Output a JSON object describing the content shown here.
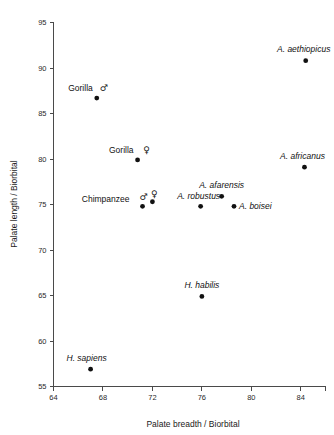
{
  "chart_data": {
    "type": "scatter",
    "title": "",
    "xlabel": "Palate breadth / Biorbital",
    "ylabel": "Palate length / Biorbital",
    "xlim": [
      64,
      86
    ],
    "ylim": [
      55,
      95
    ],
    "xticks": [
      64,
      68,
      72,
      76,
      80,
      84
    ],
    "yticks": [
      55,
      60,
      65,
      70,
      75,
      80,
      85,
      90,
      95
    ],
    "xticklabels": [
      "64",
      "68",
      "72",
      "76",
      "80",
      "84"
    ],
    "yticklabels": [
      "55",
      "60",
      "65",
      "70",
      "75",
      "80",
      "85",
      "90",
      "95"
    ],
    "grid": false,
    "legend": "none",
    "points": [
      {
        "label": "Gorilla",
        "sex_symbol": "♂",
        "italic": false,
        "x": 67.5,
        "y": 86.7,
        "label_dx": -4,
        "label_dy": -7,
        "label_anchor": "end",
        "symbol_dx": 7,
        "symbol_dy": -7
      },
      {
        "label": "Gorilla",
        "sex_symbol": "♀",
        "italic": false,
        "x": 70.8,
        "y": 79.9,
        "label_dx": -4,
        "label_dy": -7,
        "label_anchor": "end",
        "symbol_dx": 9,
        "symbol_dy": -7
      },
      {
        "label": "Chimpanzee",
        "sex_symbol": "♂",
        "italic": false,
        "x": 71.2,
        "y": 74.8,
        "label_dx": -13,
        "label_dy": -4,
        "label_anchor": "end",
        "symbol_dx": 1,
        "symbol_dy": -6
      },
      {
        "label": "",
        "sex_symbol": "♀",
        "italic": false,
        "x": 72.0,
        "y": 75.3,
        "label_dx": 0,
        "label_dy": 0,
        "label_anchor": "start",
        "symbol_dx": 2,
        "symbol_dy": -5
      },
      {
        "label": "A. robustus",
        "sex_symbol": "",
        "italic": true,
        "x": 75.9,
        "y": 74.8,
        "label_dx": -2,
        "label_dy": -7,
        "label_anchor": "middle",
        "symbol_dx": 0,
        "symbol_dy": 0
      },
      {
        "label": "A. afarensis",
        "sex_symbol": "",
        "italic": true,
        "x": 77.6,
        "y": 75.9,
        "label_dx": 0,
        "label_dy": -8,
        "label_anchor": "middle",
        "symbol_dx": 0,
        "symbol_dy": 0
      },
      {
        "label": "A. boisei",
        "sex_symbol": "",
        "italic": true,
        "x": 78.6,
        "y": 74.8,
        "label_dx": 5,
        "label_dy": 3,
        "label_anchor": "start",
        "symbol_dx": 0,
        "symbol_dy": 0
      },
      {
        "label": "A. africanus",
        "sex_symbol": "",
        "italic": true,
        "x": 84.3,
        "y": 79.1,
        "label_dx": -2,
        "label_dy": -8,
        "label_anchor": "middle",
        "symbol_dx": 0,
        "symbol_dy": 0
      },
      {
        "label": "A. aethiopicus",
        "sex_symbol": "",
        "italic": true,
        "x": 84.4,
        "y": 90.8,
        "label_dx": -2,
        "label_dy": -9,
        "label_anchor": "middle",
        "symbol_dx": 0,
        "symbol_dy": 0
      },
      {
        "label": "H. habilis",
        "sex_symbol": "",
        "italic": true,
        "x": 76.0,
        "y": 64.9,
        "label_dx": 0,
        "label_dy": -8,
        "label_anchor": "middle",
        "symbol_dx": 0,
        "symbol_dy": 0
      },
      {
        "label": "H. sapiens",
        "sex_symbol": "",
        "italic": true,
        "x": 67.0,
        "y": 56.9,
        "label_dx": -4,
        "label_dy": -8,
        "label_anchor": "middle",
        "symbol_dx": 0,
        "symbol_dy": 0
      }
    ]
  }
}
